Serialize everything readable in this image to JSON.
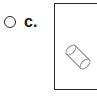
{
  "question_option": {
    "letter": "c.",
    "radio": {
      "name": "radio-unselected",
      "selected": false,
      "stroke_color": "#2b2b2b",
      "fill_color": "#ffffff"
    }
  },
  "answer_box": {
    "border_color": "#2a2a2a",
    "background_color": "#ffffff",
    "border_width_px": 2,
    "right_edge_visible": false
  },
  "figure": {
    "name": "tilted-cylinder",
    "stroke_color": "#8d8d8d",
    "fill_color": "#ffffff",
    "rotation_degrees": 45
  },
  "page": {
    "background_color": "#ffffff",
    "width_px": 97,
    "height_px": 99
  }
}
